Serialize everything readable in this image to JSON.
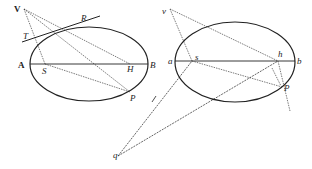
{
  "figure_left": {
    "labels": {
      "V": "V",
      "R": "R",
      "T": "T",
      "A": "A",
      "S": "S",
      "H": "H",
      "B": "B",
      "P": "P"
    }
  },
  "figure_right": {
    "labels": {
      "v": "v",
      "a": "a",
      "s": "s",
      "h": "h",
      "b": "b",
      "P": "P",
      "q": "q"
    }
  },
  "colors": {
    "ink": "#222222",
    "background": "#ffffff"
  }
}
